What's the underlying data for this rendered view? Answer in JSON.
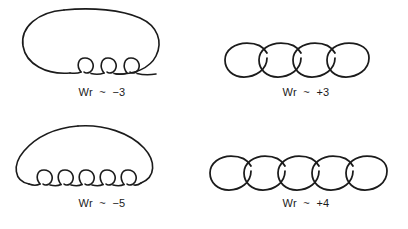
{
  "figure": {
    "background_color": "#ffffff",
    "stroke_color": "#1b1b1b",
    "panels": [
      {
        "id": "top-left",
        "name": "plectonemic-negative-3",
        "caption": "Wr  ~  −3",
        "writhe_value": -3,
        "writhe_sign": "negative",
        "conformation": "plectoneme",
        "coil_count": 3,
        "shape_description": "large closed loop with three small interwound coils along the lower edge"
      },
      {
        "id": "top-right",
        "name": "solenoidal-positive-3",
        "caption": "Wr  ~  +3",
        "writhe_value": 3,
        "writhe_sign": "positive",
        "conformation": "solenoid",
        "coil_count": 4,
        "shape_description": "horizontal chain of four overlapping ellipses"
      },
      {
        "id": "bottom-left",
        "name": "plectonemic-negative-5",
        "caption": "Wr  ~  −5",
        "writhe_value": -5,
        "writhe_sign": "negative",
        "conformation": "plectoneme",
        "coil_count": 5,
        "shape_description": "dome shaped arc with five small interwound coils along the lower edge"
      },
      {
        "id": "bottom-right",
        "name": "solenoidal-positive-4",
        "caption": "Wr  ~  +4",
        "writhe_value": 4,
        "writhe_sign": "positive",
        "conformation": "solenoid",
        "coil_count": 5,
        "shape_description": "horizontal chain of five overlapping ellipses"
      }
    ]
  }
}
